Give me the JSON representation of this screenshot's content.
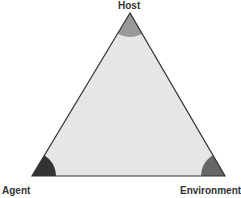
{
  "diagram": {
    "title": "",
    "type": "triangle",
    "vertices": [
      {
        "id": "host",
        "label": "Host",
        "color": "#999999"
      },
      {
        "id": "agent",
        "label": "Agent",
        "color": "#333333"
      },
      {
        "id": "environment",
        "label": "Environment",
        "color": "#666666"
      }
    ],
    "fill_color": "#e6e6e6",
    "edge_color": "#333333"
  }
}
